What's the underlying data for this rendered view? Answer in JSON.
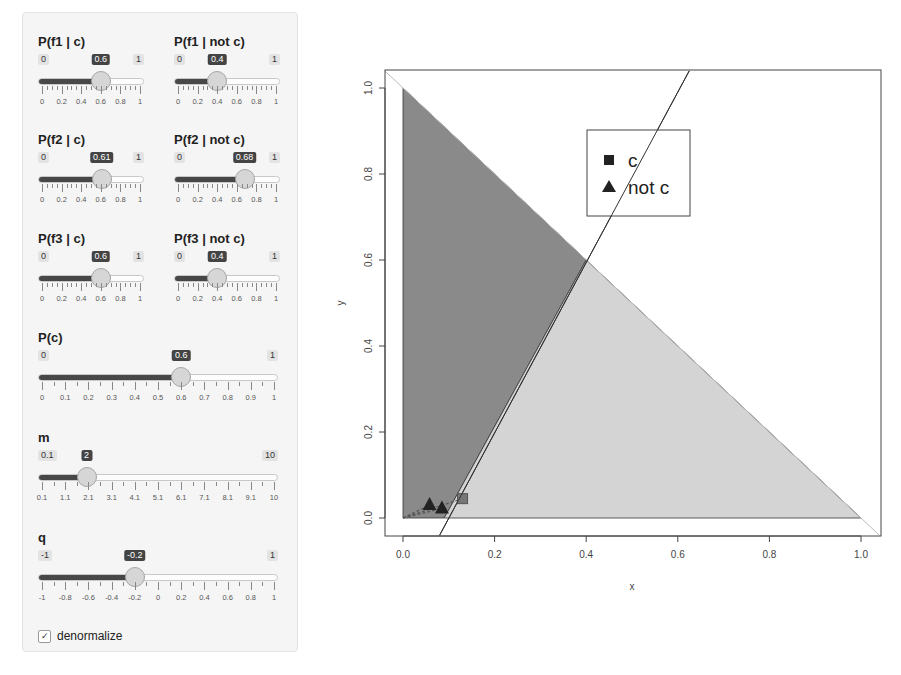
{
  "sliders": [
    {
      "id": "p_f1_c",
      "label": "P(f1 | c)",
      "min": "0",
      "max": "1",
      "value": "0.6",
      "ticks": [
        "0",
        "0.2",
        "0.4",
        "0.6",
        "0.8",
        "1"
      ]
    },
    {
      "id": "p_f1_notc",
      "label": "P(f1 | not c)",
      "min": "0",
      "max": "1",
      "value": "0.4",
      "ticks": [
        "0",
        "0.2",
        "0.4",
        "0.6",
        "0.8",
        "1"
      ]
    },
    {
      "id": "p_f2_c",
      "label": "P(f2 | c)",
      "min": "0",
      "max": "1",
      "value": "0.61",
      "ticks": [
        "0",
        "0.2",
        "0.4",
        "0.6",
        "0.8",
        "1"
      ]
    },
    {
      "id": "p_f2_notc",
      "label": "P(f2 | not c)",
      "min": "0",
      "max": "1",
      "value": "0.68",
      "ticks": [
        "0",
        "0.2",
        "0.4",
        "0.6",
        "0.8",
        "1"
      ]
    },
    {
      "id": "p_f3_c",
      "label": "P(f3 | c)",
      "min": "0",
      "max": "1",
      "value": "0.6",
      "ticks": [
        "0",
        "0.2",
        "0.4",
        "0.6",
        "0.8",
        "1"
      ]
    },
    {
      "id": "p_f3_notc",
      "label": "P(f3 | not c)",
      "min": "0",
      "max": "1",
      "value": "0.4",
      "ticks": [
        "0",
        "0.2",
        "0.4",
        "0.6",
        "0.8",
        "1"
      ]
    },
    {
      "id": "p_c",
      "label": "P(c)",
      "min": "0",
      "max": "1",
      "value": "0.6",
      "ticks": [
        "0",
        "0.1",
        "0.2",
        "0.3",
        "0.4",
        "0.5",
        "0.6",
        "0.7",
        "0.8",
        "0.9",
        "1"
      ]
    },
    {
      "id": "m",
      "label": "m",
      "min": "0.1",
      "max": "10",
      "value": "2",
      "ticks": [
        "0.1",
        "1.1",
        "2.1",
        "3.1",
        "4.1",
        "5.1",
        "6.1",
        "7.1",
        "8.1",
        "9.1",
        "10"
      ]
    },
    {
      "id": "q",
      "label": "q",
      "min": "-1",
      "max": "1",
      "value": "-0.2",
      "ticks": [
        "-1",
        "-0.8",
        "-0.6",
        "-0.4",
        "-0.2",
        "0",
        "0.2",
        "0.4",
        "0.6",
        "0.8",
        "1"
      ]
    }
  ],
  "checkbox": {
    "label": "denormalize",
    "checked": true,
    "glyph": "✓"
  },
  "chart_data": {
    "type": "scatter",
    "title": "",
    "xlabel": "x",
    "ylabel": "y",
    "xlim": [
      0,
      1
    ],
    "ylim": [
      0,
      1
    ],
    "xticks": [
      "0.0",
      "0.2",
      "0.4",
      "0.6",
      "0.8",
      "1.0"
    ],
    "yticks": [
      "0.0",
      "0.2",
      "0.4",
      "0.6",
      "0.8",
      "1.0"
    ],
    "grid": false,
    "legend": {
      "position": "top-center",
      "entries": [
        {
          "label": "c",
          "marker": "square"
        },
        {
          "label": "not c",
          "marker": "triangle"
        }
      ]
    },
    "regions": [
      {
        "name": "dark-region",
        "color": "#8a8a8a",
        "polygon": [
          [
            0,
            0
          ],
          [
            0,
            1
          ],
          [
            0.4,
            0.6
          ],
          [
            0.09,
            0
          ]
        ]
      },
      {
        "name": "light-region",
        "color": "#d4d4d4",
        "polygon": [
          [
            0.09,
            0
          ],
          [
            0.4,
            0.6
          ],
          [
            1,
            0
          ]
        ]
      }
    ],
    "lines": [
      {
        "name": "simplex-diagonal",
        "from": [
          -0.04,
          1.04
        ],
        "to": [
          1.04,
          -0.04
        ],
        "color": "#bbbbbb"
      },
      {
        "name": "decision-boundary",
        "from": [
          0.08,
          -0.04
        ],
        "to": [
          0.625,
          1.04
        ],
        "color": "#333333"
      }
    ],
    "series": [
      {
        "name": "c",
        "marker": "square",
        "points": [
          [
            0.13,
            0.045
          ]
        ]
      },
      {
        "name": "not c",
        "marker": "triangle",
        "points": [
          [
            0.058,
            0.03
          ],
          [
            0.085,
            0.022
          ]
        ]
      }
    ]
  }
}
